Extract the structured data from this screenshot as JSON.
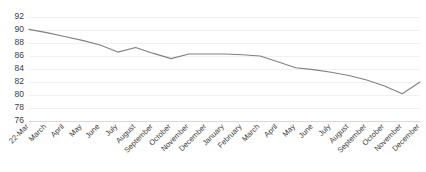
{
  "chart_data": {
    "type": "line",
    "title": "",
    "xlabel": "",
    "ylabel": "",
    "ylim": [
      76,
      92
    ],
    "yticks": [
      76,
      78,
      80,
      82,
      84,
      86,
      88,
      90,
      92
    ],
    "grid": true,
    "legend": false,
    "legend_position": "none",
    "line_color": "#808080",
    "categories": [
      "22-Mar",
      "March",
      "April",
      "May",
      "June",
      "July",
      "August",
      "September",
      "October",
      "November",
      "December",
      "January",
      "February",
      "March",
      "April",
      "May",
      "June",
      "July",
      "August",
      "September",
      "October",
      "November",
      "December"
    ],
    "values": [
      90.1,
      89.6,
      89.0,
      88.4,
      87.7,
      86.6,
      87.3,
      86.4,
      85.6,
      86.3,
      86.3,
      86.3,
      86.2,
      86.0,
      85.1,
      84.2,
      83.9,
      83.5,
      83.0,
      82.3,
      81.4,
      80.2,
      82.0
    ]
  }
}
